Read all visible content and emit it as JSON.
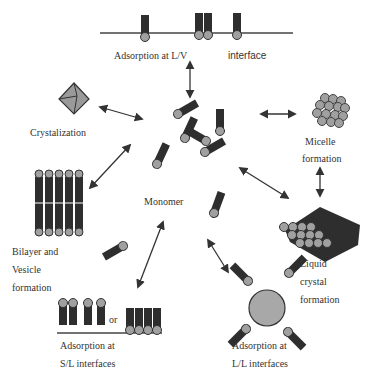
{
  "diagram": {
    "center": {
      "label": "Monomer"
    },
    "nodes": [
      {
        "id": "lv",
        "label_left": "Adsorption at L/V",
        "label_right": "interface"
      },
      {
        "id": "cryst",
        "label": "Crystalization"
      },
      {
        "id": "micelle",
        "label_line1": "Micelle",
        "label_line2": "formation"
      },
      {
        "id": "bilayer",
        "label_line1": "Bilayer and",
        "label_line2": "Vesicle",
        "label_line3": "formation"
      },
      {
        "id": "lc",
        "label_line1": "Liquid",
        "label_line2": "crystal",
        "label_line3": "formation"
      },
      {
        "id": "sl",
        "label_line1": "Adsorption at",
        "label_line2": "S/L interfaces",
        "or_text": "or"
      },
      {
        "id": "ll",
        "label_line1": "Adsorption at",
        "label_line2": "L/L interfaces"
      }
    ],
    "colors": {
      "tail": "#2e2e2e",
      "head": "#a0a0a0",
      "head_stroke": "#333333",
      "arrow": "#333333",
      "line": "#444444",
      "crystal": "#9a9a9a",
      "droplet": "#a8a8a8"
    }
  }
}
